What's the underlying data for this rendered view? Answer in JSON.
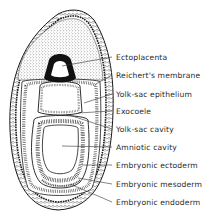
{
  "diagram": {
    "labels": [
      {
        "id": "ectoplacenta",
        "text": "Ectoplacenta",
        "y": 58
      },
      {
        "id": "reicherts-membrane",
        "text": "Reichert's membrane",
        "y": 76
      },
      {
        "id": "yolk-sac-epithelium",
        "text": "Yolk-sac epithelium",
        "y": 95
      },
      {
        "id": "exocoele",
        "text": "Exocoele",
        "y": 112
      },
      {
        "id": "yolk-sac-cavity",
        "text": "Yolk-sac cavity",
        "y": 130
      },
      {
        "id": "amniotic-cavity",
        "text": "Amniotic cavity",
        "y": 148
      },
      {
        "id": "embryonic-ectoderm",
        "text": "Embryonic ectoderm",
        "y": 166
      },
      {
        "id": "embryonic-mesoderm",
        "text": "Embryonic mesoderm",
        "y": 185
      },
      {
        "id": "embryonic-endoderm",
        "text": "Embryonic endoderm",
        "y": 203
      }
    ],
    "colors": {
      "line": "#1a1a1a",
      "background": "#ffffff",
      "text": "#2a2a2a"
    }
  }
}
